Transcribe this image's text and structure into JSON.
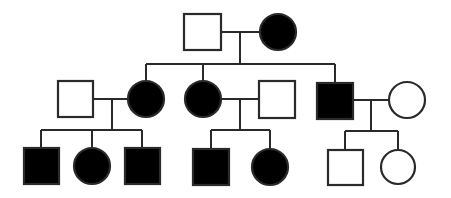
{
  "diagram": {
    "type": "pedigree-chart",
    "legend": {
      "square": "male",
      "circle": "female",
      "filled": "affected",
      "empty": "unaffected"
    },
    "colors": {
      "affected": "#000000",
      "unaffected": "#ffffff",
      "line": "#2a2a2a"
    },
    "generations": [
      {
        "id": "I",
        "individuals": [
          {
            "id": "I-1",
            "sex": "male",
            "affected": false
          },
          {
            "id": "I-2",
            "sex": "female",
            "affected": true
          }
        ]
      },
      {
        "id": "II",
        "individuals": [
          {
            "id": "II-1",
            "sex": "male",
            "affected": false,
            "note": "married-in"
          },
          {
            "id": "II-2",
            "sex": "female",
            "affected": true
          },
          {
            "id": "II-3",
            "sex": "female",
            "affected": true
          },
          {
            "id": "II-4",
            "sex": "male",
            "affected": false,
            "note": "married-in"
          },
          {
            "id": "II-5",
            "sex": "male",
            "affected": true
          },
          {
            "id": "II-6",
            "sex": "female",
            "affected": false,
            "note": "married-in"
          }
        ]
      },
      {
        "id": "III",
        "individuals": [
          {
            "id": "III-1",
            "sex": "male",
            "affected": true
          },
          {
            "id": "III-2",
            "sex": "female",
            "affected": true
          },
          {
            "id": "III-3",
            "sex": "male",
            "affected": true
          },
          {
            "id": "III-4",
            "sex": "male",
            "affected": true
          },
          {
            "id": "III-5",
            "sex": "female",
            "affected": true
          },
          {
            "id": "III-6",
            "sex": "male",
            "affected": false
          },
          {
            "id": "III-7",
            "sex": "female",
            "affected": false
          }
        ]
      }
    ],
    "matings": [
      {
        "partners": [
          "I-1",
          "I-2"
        ],
        "children": [
          "II-2",
          "II-3",
          "II-5"
        ]
      },
      {
        "partners": [
          "II-1",
          "II-2"
        ],
        "children": [
          "III-1",
          "III-2",
          "III-3"
        ]
      },
      {
        "partners": [
          "II-3",
          "II-4"
        ],
        "children": [
          "III-4",
          "III-5"
        ]
      },
      {
        "partners": [
          "II-5",
          "II-6"
        ],
        "children": [
          "III-6",
          "III-7"
        ]
      }
    ]
  }
}
